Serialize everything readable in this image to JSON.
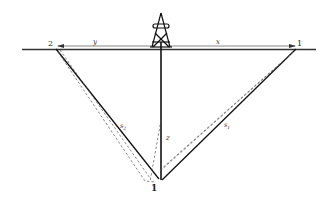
{
  "diagram": {
    "labels": {
      "point_left": "2",
      "point_right": "1",
      "bottom_point": "1",
      "distance_left": "y",
      "distance_right": "x",
      "depth": "z",
      "slant_left": "s",
      "slant_left_sub": "2",
      "slant_right": "s",
      "slant_right_sub": "1"
    },
    "elements": {
      "derrick": "drilling-rig-icon",
      "surface": "ground-surface-line",
      "well": "vertical-borehole",
      "solid_paths": [
        "s2",
        "s1"
      ],
      "dashed_paths": [
        "ray-left",
        "ray-right"
      ]
    },
    "colors": {
      "line": "#1a1a1a",
      "dashed": "#555555",
      "background": "#ffffff"
    }
  }
}
